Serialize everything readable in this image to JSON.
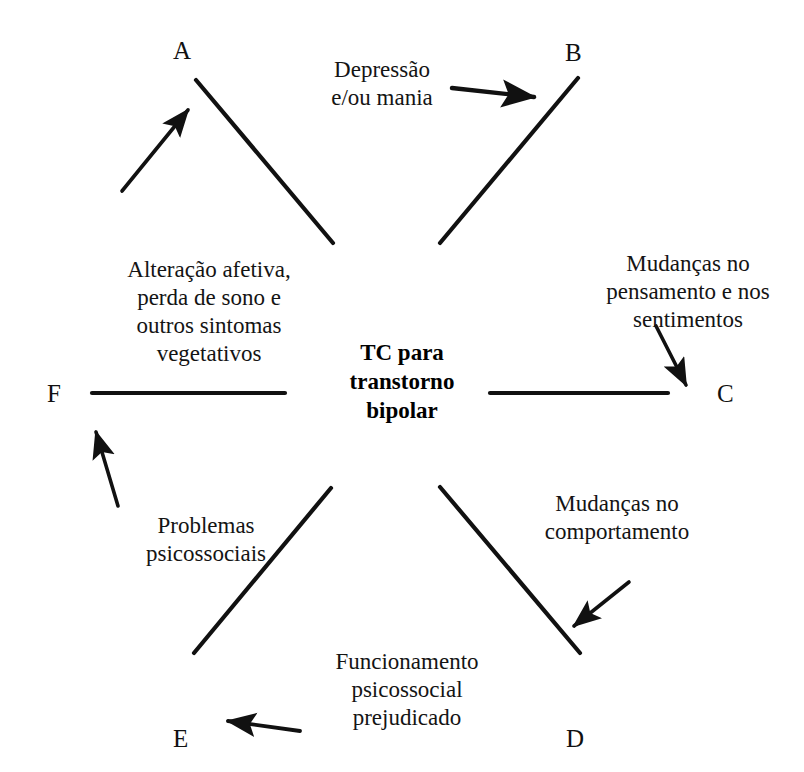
{
  "diagram": {
    "title": "TC para transtorno bipolar",
    "center_label": {
      "line1": "TC para",
      "line2": "transtorno",
      "line3": "bipolar"
    },
    "nodes": [
      {
        "id": "A",
        "label": "A"
      },
      {
        "id": "B",
        "label": "B"
      },
      {
        "id": "C",
        "label": "C"
      },
      {
        "id": "D",
        "label": "D"
      },
      {
        "id": "E",
        "label": "E"
      },
      {
        "id": "F",
        "label": "F"
      }
    ],
    "captions": {
      "depressao": {
        "line1": "Depressão",
        "line2": "e/ou mania"
      },
      "mudancas_pensamento": {
        "line1": "Mudanças no",
        "line2": "pensamento e nos",
        "line3": "sentimentos"
      },
      "mudancas_comportamento": {
        "line1": "Mudanças no",
        "line2": "comportamento"
      },
      "funcionamento": {
        "line1": "Funcionamento",
        "line2": "psicossocial",
        "line3": "prejudicado"
      },
      "problemas": {
        "line1": "Problemas",
        "line2": "psicossociais"
      },
      "alteracao": {
        "line1": "Alteração afetiva,",
        "line2": "perda de sono e",
        "line3": "outros sintomas",
        "line4": "vegetativos"
      }
    },
    "colors": {
      "background": "#ffffff",
      "stroke": "#111111",
      "text": "#141414"
    }
  }
}
